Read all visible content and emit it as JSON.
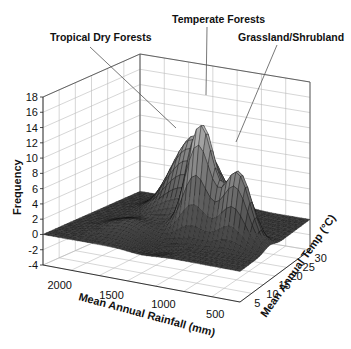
{
  "chart_data": {
    "type": "surface3d",
    "title": "",
    "zlabel": "Frequency",
    "xlabel": "Mean Annual Rainfall (mm)",
    "ylabel": "Mean Annual Temp (°C)",
    "zlim": [
      -4,
      18
    ],
    "z_ticks": [
      "18",
      "16",
      "14",
      "12",
      "10",
      "8",
      "6",
      "4",
      "2",
      "0",
      "-2",
      "-4"
    ],
    "x_ticks": [
      "2000",
      "1500",
      "1000",
      "500"
    ],
    "y_ticks": [
      "5",
      "10",
      "15",
      "20",
      "25",
      "30"
    ],
    "grid": true,
    "annotations": [
      {
        "text": "Tropical Dry Forests",
        "peak_height": 10
      },
      {
        "text": "Temperate Forests",
        "peak_height": 14
      },
      {
        "text": "Grassland/Shrubland",
        "peak_height": 9
      }
    ],
    "peaks": [
      {
        "label": "Tropical Dry Forests",
        "rainfall_mm": 1300,
        "temp_c": 24,
        "frequency": 10
      },
      {
        "label": "Temperate Forests",
        "rainfall_mm": 1000,
        "temp_c": 15,
        "frequency": 14
      },
      {
        "label": "Grassland/Shrubland",
        "rainfall_mm": 550,
        "temp_c": 15,
        "frequency": 9
      }
    ]
  },
  "labels": {
    "tropical": "Tropical Dry Forests",
    "temperate": "Temperate Forests",
    "grassland": "Grassland/Shrubland",
    "zaxis": "Frequency",
    "xaxis": "Mean Annual Rainfall (mm)",
    "yaxis": "Mean Annual Temp (°C)"
  }
}
